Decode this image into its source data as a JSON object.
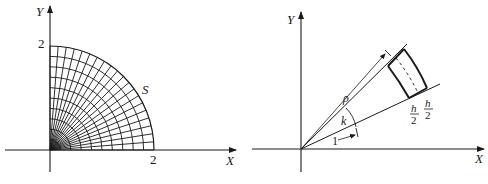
{
  "left_figure": {
    "axis_labels": {
      "x": "X",
      "y": "Y"
    },
    "tick_labels": {
      "x": "2",
      "y": "2"
    },
    "region_label": "S",
    "grid": {
      "radius": 2,
      "rings": 10,
      "rays": 20,
      "quadrant": "first"
    }
  },
  "right_figure": {
    "axis_labels": {
      "x": "X",
      "y": "Y"
    },
    "labels": {
      "rho": "ρ",
      "angle": "k",
      "unit": "1",
      "half_h_num_1": "h",
      "half_h_den_1": "2",
      "half_h_num_2": "h",
      "half_h_den_2": "2"
    }
  },
  "colors": {
    "line": "#1a1a1a",
    "background": "#ffffff"
  }
}
